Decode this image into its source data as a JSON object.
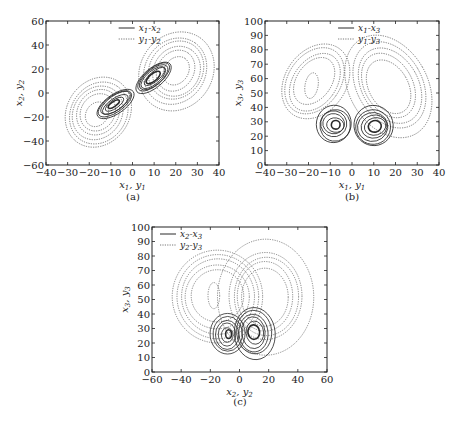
{
  "chart_data": [
    {
      "id": "a",
      "type": "line",
      "panel_label": "(a)",
      "title": "",
      "xlabel": "x1, y1",
      "ylabel": "x2, y2",
      "xlim": [
        -40,
        40
      ],
      "ylim": [
        -60,
        60
      ],
      "xticks": [
        -40,
        -30,
        -20,
        -10,
        0,
        10,
        20,
        30,
        40
      ],
      "yticks": [
        -60,
        -40,
        -20,
        0,
        20,
        40,
        60
      ],
      "grid": false,
      "legend_position": "upper center",
      "series": [
        {
          "name": "x1-x2",
          "style": "solid",
          "description": "Lorenz-like attractor projection, two lobes centered near (-8,-10) and (10,15), extent x ~[-18,19], y ~[-22,22]"
        },
        {
          "name": "y1-y2",
          "style": "dotted",
          "description": "Larger two-lobe attractor, extent x ~[-30,37], y ~[-43,52]"
        }
      ]
    },
    {
      "id": "b",
      "type": "line",
      "panel_label": "(b)",
      "title": "",
      "xlabel": "x1, y1",
      "ylabel": "x3, y3",
      "xlim": [
        -40,
        40
      ],
      "ylim": [
        0,
        100
      ],
      "xticks": [
        -40,
        -30,
        -20,
        -10,
        0,
        10,
        20,
        30,
        40
      ],
      "yticks": [
        0,
        10,
        20,
        30,
        40,
        50,
        60,
        70,
        80,
        90,
        100
      ],
      "grid": false,
      "legend_position": "upper center",
      "series": [
        {
          "name": "x1-x3",
          "style": "solid",
          "description": "Butterfly attractor, lobes centered near (-8,28) and (10,28), extent x ~[-15,18], y ~[5,47]"
        },
        {
          "name": "y1-y3",
          "style": "dotted",
          "description": "Larger butterfly, extent x ~[-33,37], y ~[15,93], inner ring near (-18,55)"
        }
      ]
    },
    {
      "id": "c",
      "type": "line",
      "panel_label": "(c)",
      "title": "",
      "xlabel": "x2, y2",
      "ylabel": "x3, y3",
      "xlim": [
        -60,
        60
      ],
      "ylim": [
        0,
        100
      ],
      "xticks": [
        -60,
        -40,
        -20,
        0,
        20,
        40,
        60
      ],
      "yticks": [
        0,
        10,
        20,
        30,
        40,
        50,
        60,
        70,
        80,
        90,
        100
      ],
      "grid": false,
      "legend_position": "upper left",
      "series": [
        {
          "name": "x2-x3",
          "style": "solid",
          "description": "Two lobes centered near (-8,27) and (10,28), extent x ~[-22,25], y ~[3,47]"
        },
        {
          "name": "y2-y3",
          "style": "dotted",
          "description": "Large loops, extent x ~[-45,52], y ~[12,92], inner ring near (-17,53)"
        }
      ]
    }
  ],
  "figure": {
    "panels": [
      {
        "label": "(a)",
        "xlabel_main": "x",
        "xlabel_sub1": "1",
        "xlabel_main2": "y",
        "xlabel_sub2": "1",
        "ylabel_main": "x",
        "ylabel_sub1": "2",
        "ylabel_main2": "y",
        "ylabel_sub2": "2",
        "legend": [
          {
            "main": "x",
            "sub": "1",
            "sep": "-",
            "main2": "x",
            "sub2": "2"
          },
          {
            "main": "y",
            "sub": "1",
            "sep": "-",
            "main2": "y",
            "sub2": "2"
          }
        ]
      },
      {
        "label": "(b)",
        "xlabel_main": "x",
        "xlabel_sub1": "1",
        "xlabel_main2": "y",
        "xlabel_sub2": "1",
        "ylabel_main": "x",
        "ylabel_sub1": "3",
        "ylabel_main2": "y",
        "ylabel_sub2": "3",
        "legend": [
          {
            "main": "x",
            "sub": "1",
            "sep": "-",
            "main2": "x",
            "sub2": "3"
          },
          {
            "main": "y",
            "sub": "1",
            "sep": "-",
            "main2": "y",
            "sub2": "3"
          }
        ]
      },
      {
        "label": "(c)",
        "xlabel_main": "x",
        "xlabel_sub1": "2",
        "xlabel_main2": "y",
        "xlabel_sub2": "2",
        "ylabel_main": "x",
        "ylabel_sub1": "3",
        "ylabel_main2": "y",
        "ylabel_sub2": "3",
        "legend": [
          {
            "main": "x",
            "sub": "2",
            "sep": "-",
            "main2": "x",
            "sub2": "3"
          },
          {
            "main": "y",
            "sub": "2",
            "sep": "-",
            "main2": "y",
            "sub2": "3"
          }
        ]
      }
    ]
  },
  "colors": {
    "axis": "#222222",
    "solid_line": "#2a2a2a",
    "dotted_line": "#555555"
  }
}
